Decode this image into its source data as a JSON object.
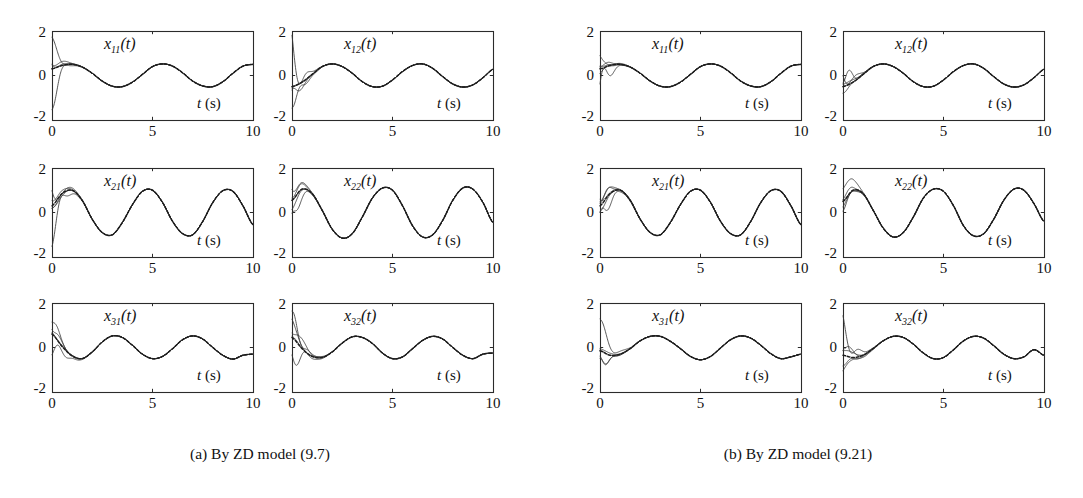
{
  "figure": {
    "panel_count": 12,
    "groups": [
      {
        "id": "group-a",
        "caption": "(a) By ZD model (9.7)",
        "panels": [
          {
            "id": "a-x11",
            "var_base": "x",
            "var_sub": "11",
            "var_suffix": "(t)",
            "xlabel_italic": "t",
            "xlabel_rest": " (s)"
          },
          {
            "id": "a-x12",
            "var_base": "x",
            "var_sub": "12",
            "var_suffix": "(t)",
            "xlabel_italic": "t",
            "xlabel_rest": " (s)"
          },
          {
            "id": "a-x21",
            "var_base": "x",
            "var_sub": "21",
            "var_suffix": "(t)",
            "xlabel_italic": "t",
            "xlabel_rest": " (s)"
          },
          {
            "id": "a-x22",
            "var_base": "x",
            "var_sub": "22",
            "var_suffix": "(t)",
            "xlabel_italic": "t",
            "xlabel_rest": " (s)"
          },
          {
            "id": "a-x31",
            "var_base": "x",
            "var_sub": "31",
            "var_suffix": "(t)",
            "xlabel_italic": "t",
            "xlabel_rest": " (s)"
          },
          {
            "id": "a-x32",
            "var_base": "x",
            "var_sub": "32",
            "var_suffix": "(t)",
            "xlabel_italic": "t",
            "xlabel_rest": " (s)"
          }
        ]
      },
      {
        "id": "group-b",
        "caption": "(b) By ZD model (9.21)",
        "panels": [
          {
            "id": "b-x11",
            "var_base": "x",
            "var_sub": "11",
            "var_suffix": "(t)",
            "xlabel_italic": "t",
            "xlabel_rest": " (s)"
          },
          {
            "id": "b-x12",
            "var_base": "x",
            "var_sub": "12",
            "var_suffix": "(t)",
            "xlabel_italic": "t",
            "xlabel_rest": " (s)"
          },
          {
            "id": "b-x21",
            "var_base": "x",
            "var_sub": "21",
            "var_suffix": "(t)",
            "xlabel_italic": "t",
            "xlabel_rest": " (s)"
          },
          {
            "id": "b-x22",
            "var_base": "x",
            "var_sub": "22",
            "var_suffix": "(t)",
            "xlabel_italic": "t",
            "xlabel_rest": " (s)"
          },
          {
            "id": "b-x31",
            "var_base": "x",
            "var_sub": "31",
            "var_suffix": "(t)",
            "xlabel_italic": "t",
            "xlabel_rest": " (s)"
          },
          {
            "id": "b-x32",
            "var_base": "x",
            "var_sub": "32",
            "var_suffix": "(t)",
            "xlabel_italic": "t",
            "xlabel_rest": " (s)"
          }
        ]
      }
    ],
    "axis": {
      "y_ticks": [
        "2",
        "0",
        "-2"
      ],
      "x_ticks": [
        "0",
        "5",
        "10"
      ],
      "xlim": [
        0,
        10
      ],
      "ylim": [
        -2,
        2
      ],
      "xlabel_text": "t (s)",
      "grid": false,
      "legend": "none"
    },
    "colors": {
      "frame": "#2b2b2b",
      "trajectory": "#3a3a3a",
      "reference": "#1c1c1c",
      "background": "#ffffff"
    }
  },
  "chart_data": {
    "type": "line",
    "title": "",
    "xlabel": "t (s)",
    "ylabel": "",
    "xlim": [
      0,
      10
    ],
    "ylim": [
      -2,
      2
    ],
    "xticks": [
      0,
      5,
      10
    ],
    "yticks": [
      -2,
      0,
      2
    ],
    "grid": false,
    "legend": "none",
    "panels": [
      {
        "id": "a-x11",
        "group": "(a) By ZD model (9.7)",
        "label": "x11(t)",
        "reference": {
          "name": "theoretical solution",
          "style": "dashed",
          "form": "0.5*sin(1.4*t - 0.5) + 0.05",
          "t": [
            0,
            0.5,
            1,
            1.5,
            2,
            2.5,
            3,
            3.5,
            4,
            4.5,
            5,
            5.5,
            6,
            6.5,
            7,
            7.5,
            8,
            8.5,
            9,
            9.5,
            10
          ],
          "y": [
            0.3,
            0.45,
            0.5,
            0.38,
            0.1,
            -0.25,
            -0.48,
            -0.5,
            -0.3,
            0.05,
            0.4,
            0.52,
            0.42,
            0.12,
            -0.25,
            -0.47,
            -0.5,
            -0.28,
            0.1,
            0.42,
            0.5
          ]
        },
        "trajectories": [
          {
            "y0": 2.0
          },
          {
            "y0": 0.9
          },
          {
            "y0": 0.55
          },
          {
            "y0": 0.3
          },
          {
            "y0": -2.0
          }
        ]
      },
      {
        "id": "a-x12",
        "group": "(a) By ZD model (9.7)",
        "label": "x12(t)",
        "reference": {
          "name": "theoretical solution",
          "style": "dashed",
          "form": "0.55*sin(1.4*t - 1.9) - 0.05",
          "t": [
            0,
            0.5,
            1,
            1.5,
            2,
            2.5,
            3,
            3.5,
            4,
            4.5,
            5,
            5.5,
            6,
            6.5,
            7,
            7.5,
            8,
            8.5,
            9,
            9.5,
            10
          ],
          "y": [
            -0.5,
            -0.3,
            0.05,
            0.4,
            0.52,
            0.4,
            0.1,
            -0.28,
            -0.5,
            -0.48,
            -0.2,
            0.18,
            0.45,
            0.52,
            0.32,
            -0.05,
            -0.38,
            -0.52,
            -0.42,
            -0.1,
            0.28
          ]
        },
        "trajectories": [
          {
            "y0": 2.0
          },
          {
            "y0": -1.55
          },
          {
            "y0": -1.8
          },
          {
            "y0": -0.6
          },
          {
            "y0": -0.45
          }
        ]
      },
      {
        "id": "a-x21",
        "group": "(a) By ZD model (9.7)",
        "label": "x21(t)",
        "reference": {
          "name": "theoretical solution",
          "style": "dashed",
          "form": "1.0*sin(1.5*t + 0.3)",
          "t": [
            0,
            0.5,
            1,
            1.5,
            2,
            2.5,
            3,
            3.5,
            4,
            4.5,
            5,
            5.5,
            6,
            6.5,
            7,
            7.5,
            8,
            8.5,
            9,
            9.5,
            10
          ],
          "y": [
            0.3,
            0.85,
            1.0,
            0.55,
            -0.3,
            -0.9,
            -1.0,
            -0.45,
            0.35,
            0.95,
            1.0,
            0.45,
            -0.4,
            -0.95,
            -1.0,
            -0.4,
            0.45,
            0.98,
            0.95,
            0.3,
            -0.55
          ]
        },
        "trajectories": [
          {
            "y0": 2.0
          },
          {
            "y0": 1.1
          },
          {
            "y0": 0.1
          },
          {
            "y0": -0.05
          },
          {
            "y0": -1.85
          }
        ]
      },
      {
        "id": "a-x22",
        "group": "(a) By ZD model (9.7)",
        "label": "x22(t)",
        "reference": {
          "name": "theoretical solution",
          "style": "dashed",
          "form": "1.1*sin(1.45*t + 0.55)",
          "t": [
            0,
            0.5,
            1,
            1.5,
            2,
            2.5,
            3,
            3.5,
            4,
            4.5,
            5,
            5.5,
            6,
            6.5,
            7,
            7.5,
            8,
            8.5,
            9,
            9.5,
            10
          ],
          "y": [
            0.55,
            1.05,
            0.85,
            0.1,
            -0.75,
            -1.15,
            -0.95,
            -0.2,
            0.65,
            1.1,
            1.0,
            0.3,
            -0.6,
            -1.1,
            -1.0,
            -0.35,
            0.55,
            1.1,
            1.05,
            0.45,
            -0.45
          ]
        },
        "trajectories": [
          {
            "y0": 2.0
          },
          {
            "y0": 1.35
          },
          {
            "y0": 0.55
          },
          {
            "y0": 0.05
          },
          {
            "y0": -1.4
          }
        ]
      },
      {
        "id": "a-x31",
        "group": "(a) By ZD model (9.7)",
        "label": "x31(t)",
        "reference": {
          "name": "theoretical solution",
          "style": "dashed",
          "form": "0.5*sin(1.45*t - 1.6) + 0.02",
          "t": [
            0,
            0.5,
            1,
            1.5,
            2,
            2.5,
            3,
            3.5,
            4,
            4.5,
            5,
            5.5,
            6,
            6.5,
            7,
            7.5,
            8,
            8.5,
            9,
            9.5,
            10
          ],
          "y": [
            0.6,
            0.05,
            -0.38,
            -0.5,
            -0.2,
            0.25,
            0.52,
            0.45,
            0.1,
            -0.3,
            -0.5,
            -0.4,
            -0.05,
            0.35,
            0.52,
            0.38,
            0.0,
            -0.35,
            -0.52,
            -0.35,
            -0.3
          ]
        },
        "trajectories": [
          {
            "y0": 1.95
          },
          {
            "y0": 1.35
          },
          {
            "y0": 0.75
          },
          {
            "y0": 0.6
          },
          {
            "y0": -0.65
          }
        ]
      },
      {
        "id": "a-x32",
        "group": "(a) By ZD model (9.7)",
        "label": "x32(t)",
        "reference": {
          "name": "theoretical solution",
          "style": "dashed",
          "form": "0.48*sin(1.42*t - 2.2) + 0.02",
          "t": [
            0,
            0.5,
            1,
            1.5,
            2,
            2.5,
            3,
            3.5,
            4,
            4.5,
            5,
            5.5,
            6,
            6.5,
            7,
            7.5,
            8,
            8.5,
            9,
            9.5,
            10
          ],
          "y": [
            0.45,
            -0.05,
            -0.4,
            -0.45,
            -0.2,
            0.2,
            0.48,
            0.45,
            0.18,
            -0.25,
            -0.5,
            -0.42,
            -0.05,
            0.32,
            0.5,
            0.38,
            0.0,
            -0.35,
            -0.5,
            -0.3,
            -0.25
          ]
        },
        "trajectories": [
          {
            "y0": 2.0
          },
          {
            "y0": 1.85
          },
          {
            "y0": 1.3
          },
          {
            "y0": 0.55
          },
          {
            "y0": -1.0
          }
        ]
      },
      {
        "id": "b-x11",
        "group": "(b) By ZD model (9.21)",
        "label": "x11(t)",
        "reference": {
          "name": "theoretical solution",
          "style": "dashed",
          "form": "0.5*sin(1.4*t - 0.5) + 0.05",
          "t": [
            0,
            0.5,
            1,
            1.5,
            2,
            2.5,
            3,
            3.5,
            4,
            4.5,
            5,
            5.5,
            6,
            6.5,
            7,
            7.5,
            8,
            8.5,
            9,
            9.5,
            10
          ],
          "y": [
            0.3,
            0.45,
            0.5,
            0.38,
            0.1,
            -0.25,
            -0.48,
            -0.5,
            -0.3,
            0.05,
            0.4,
            0.52,
            0.42,
            0.12,
            -0.25,
            -0.47,
            -0.5,
            -0.28,
            0.1,
            0.42,
            0.5
          ]
        },
        "trajectories": [
          {
            "y0": 1.0
          },
          {
            "y0": 0.75
          },
          {
            "y0": 0.45
          },
          {
            "y0": 0.05
          },
          {
            "y0": -1.5
          }
        ]
      },
      {
        "id": "b-x12",
        "group": "(b) By ZD model (9.21)",
        "label": "x12(t)",
        "reference": {
          "name": "theoretical solution",
          "style": "dashed",
          "form": "0.55*sin(1.4*t - 1.9) - 0.05",
          "t": [
            0,
            0.5,
            1,
            1.5,
            2,
            2.5,
            3,
            3.5,
            4,
            4.5,
            5,
            5.5,
            6,
            6.5,
            7,
            7.5,
            8,
            8.5,
            9,
            9.5,
            10
          ],
          "y": [
            -0.5,
            -0.3,
            0.05,
            0.4,
            0.52,
            0.4,
            0.1,
            -0.28,
            -0.5,
            -0.48,
            -0.2,
            0.18,
            0.45,
            0.52,
            0.32,
            -0.05,
            -0.38,
            -0.52,
            -0.42,
            -0.1,
            0.28
          ]
        },
        "trajectories": [
          {
            "y0": 0.7
          },
          {
            "y0": 0.65
          },
          {
            "y0": 0.1
          },
          {
            "y0": -0.45
          },
          {
            "y0": -0.85
          }
        ]
      },
      {
        "id": "b-x21",
        "group": "(b) By ZD model (9.21)",
        "label": "x21(t)",
        "reference": {
          "name": "theoretical solution",
          "style": "dashed",
          "form": "1.0*sin(1.5*t + 0.3)",
          "t": [
            0,
            0.5,
            1,
            1.5,
            2,
            2.5,
            3,
            3.5,
            4,
            4.5,
            5,
            5.5,
            6,
            6.5,
            7,
            7.5,
            8,
            8.5,
            9,
            9.5,
            10
          ],
          "y": [
            0.3,
            0.85,
            1.0,
            0.55,
            -0.3,
            -0.9,
            -1.0,
            -0.45,
            0.35,
            0.95,
            1.0,
            0.45,
            -0.4,
            -0.95,
            -1.0,
            -0.4,
            0.45,
            0.98,
            0.95,
            0.3,
            -0.55
          ]
        },
        "trajectories": [
          {
            "y0": 1.15
          },
          {
            "y0": 1.0
          },
          {
            "y0": 0.85
          },
          {
            "y0": 0.0
          },
          {
            "y0": -1.1
          }
        ]
      },
      {
        "id": "b-x22",
        "group": "(b) By ZD model (9.21)",
        "label": "x22(t)",
        "reference": {
          "name": "theoretical solution",
          "style": "dashed",
          "form": "1.05*sin(1.45*t + 0.5)",
          "t": [
            0,
            0.5,
            1,
            1.5,
            2,
            2.5,
            3,
            3.5,
            4,
            4.5,
            5,
            5.5,
            6,
            6.5,
            7,
            7.5,
            8,
            8.5,
            9,
            9.5,
            10
          ],
          "y": [
            0.5,
            1.0,
            0.85,
            0.1,
            -0.7,
            -1.1,
            -0.9,
            -0.2,
            0.65,
            1.05,
            0.95,
            0.3,
            -0.6,
            -1.05,
            -0.95,
            -0.3,
            0.55,
            1.05,
            1.0,
            0.4,
            -0.4
          ]
        },
        "trajectories": [
          {
            "y0": 1.65
          },
          {
            "y0": 1.0
          },
          {
            "y0": 0.55
          },
          {
            "y0": 0.1
          },
          {
            "y0": 0.0
          }
        ]
      },
      {
        "id": "b-x31",
        "group": "(b) By ZD model (9.21)",
        "label": "x31(t)",
        "reference": {
          "name": "theoretical solution",
          "style": "dashed",
          "form": "0.5*sin(1.45*t - 1.6) + 0.02",
          "t": [
            0,
            0.5,
            1,
            1.5,
            2,
            2.5,
            3,
            3.5,
            4,
            4.5,
            5,
            5.5,
            6,
            6.5,
            7,
            7.5,
            8,
            8.5,
            9,
            9.5,
            10
          ],
          "y": [
            -0.15,
            -0.35,
            -0.3,
            -0.05,
            0.3,
            0.5,
            0.5,
            0.28,
            -0.05,
            -0.4,
            -0.55,
            -0.4,
            -0.02,
            0.35,
            0.52,
            0.42,
            0.1,
            -0.28,
            -0.5,
            -0.42,
            -0.3
          ]
        },
        "trajectories": [
          {
            "y0": 1.95
          },
          {
            "y0": 0.2
          },
          {
            "y0": -0.1
          },
          {
            "y0": -1.05
          },
          {
            "y0": -1.3
          }
        ]
      },
      {
        "id": "b-x32",
        "group": "(b) By ZD model (9.21)",
        "label": "x32(t)",
        "reference": {
          "name": "theoretical solution",
          "style": "dashed",
          "form": "0.48*sin(1.42*t - 2.2) + 0.02",
          "t": [
            0,
            0.5,
            1,
            1.5,
            2,
            2.5,
            3,
            3.5,
            4,
            4.5,
            5,
            5.5,
            6,
            6.5,
            7,
            7.5,
            8,
            8.5,
            9,
            9.5,
            10
          ],
          "y": [
            -0.35,
            -0.45,
            -0.35,
            -0.05,
            0.3,
            0.5,
            0.45,
            0.15,
            -0.25,
            -0.5,
            -0.45,
            -0.1,
            0.3,
            0.5,
            0.42,
            0.08,
            -0.3,
            -0.5,
            -0.42,
            -0.1,
            -0.35
          ]
        },
        "trajectories": [
          {
            "y0": 1.95
          },
          {
            "y0": 0.55
          },
          {
            "y0": 0.4
          },
          {
            "y0": -0.95
          },
          {
            "y0": -1.3
          }
        ]
      }
    ]
  }
}
